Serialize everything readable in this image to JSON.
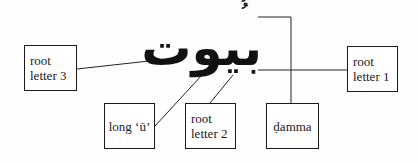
{
  "diagram": {
    "word": "بيوت",
    "vowel_marks": "ُ ُ",
    "labels": {
      "root_letter_3": [
        "root",
        "letter 3"
      ],
      "long_u": [
        "long ‘ū’"
      ],
      "root_letter_2": [
        "root",
        "letter 2"
      ],
      "damma": [
        "ḍamma"
      ],
      "root_letter_1": [
        "root",
        "letter 1"
      ]
    }
  }
}
